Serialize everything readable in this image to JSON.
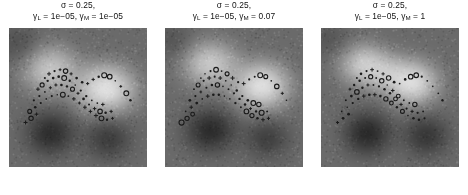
{
  "figure": {
    "background_color": "#ffffff",
    "panel_count": 3,
    "colormap": "gray"
  },
  "panels": [
    {
      "id": "panel-1",
      "title_line1": "σ = 0.25,",
      "title_line2_a": "γ",
      "title_line2_a_sub": "L",
      "title_line2_b": " = 1e−05,  ",
      "title_line2_c": "γ",
      "title_line2_c_sub": "M",
      "title_line2_d": " = 1e−05",
      "sigma": "0.25",
      "gamma_L": "1e-05",
      "gamma_M": "1e-05"
    },
    {
      "id": "panel-2",
      "title_line1": "σ = 0.25,",
      "title_line2_a": "γ",
      "title_line2_a_sub": "L",
      "title_line2_b": " = 1e−05, ",
      "title_line2_c": "γ",
      "title_line2_c_sub": "M",
      "title_line2_d": " = 0.07",
      "sigma": "0.25",
      "gamma_L": "1e-05",
      "gamma_M": "0.07"
    },
    {
      "id": "panel-3",
      "title_line1": "σ = 0.25,",
      "title_line2_a": "γ",
      "title_line2_a_sub": "L",
      "title_line2_b": " = 1e−05, ",
      "title_line2_c": "γ",
      "title_line2_c_sub": "M",
      "title_line2_d": " = 1",
      "sigma": "0.25",
      "gamma_L": "1e-05",
      "gamma_M": "1"
    }
  ],
  "chart_data": {
    "type": "heatmap",
    "title": "",
    "xlabel": "",
    "ylabel": "",
    "grid": false,
    "legend": "none",
    "colormap": "gray",
    "axis_ticks": [],
    "panels": [
      {
        "name": "σ = 0.25, γ_L = 1e-05, γ_M = 1e-05",
        "field_lobes": [
          {
            "kind": "bright",
            "cx": 0.3,
            "cy": 0.3,
            "rx": 0.3,
            "ry": 0.24,
            "intensity": 0.78
          },
          {
            "kind": "bright",
            "cx": 0.7,
            "cy": 0.44,
            "rx": 0.33,
            "ry": 0.26,
            "intensity": 1.0
          },
          {
            "kind": "dark",
            "cx": 0.3,
            "cy": 0.76,
            "rx": 0.26,
            "ry": 0.22,
            "intensity": 0.8
          },
          {
            "kind": "dark",
            "cx": 0.72,
            "cy": 0.8,
            "rx": 0.24,
            "ry": 0.2,
            "intensity": 0.62
          },
          {
            "kind": "dark",
            "cx": 0.06,
            "cy": 0.12,
            "rx": 0.22,
            "ry": 0.2,
            "intensity": 0.35
          }
        ],
        "scatter": {
          "marker_shapes": [
            "dot",
            "circle",
            "cross"
          ],
          "marker_color": "#1a1a1a",
          "n_points": 64,
          "x": [
            0.26,
            0.29,
            0.33,
            0.37,
            0.41,
            0.45,
            0.49,
            0.53,
            0.21,
            0.24,
            0.28,
            0.32,
            0.36,
            0.4,
            0.44,
            0.48,
            0.52,
            0.56,
            0.6,
            0.64,
            0.68,
            0.18,
            0.22,
            0.26,
            0.3,
            0.34,
            0.38,
            0.42,
            0.46,
            0.5,
            0.54,
            0.58,
            0.62,
            0.66,
            0.7,
            0.74,
            0.15,
            0.19,
            0.23,
            0.27,
            0.31,
            0.35,
            0.39,
            0.43,
            0.47,
            0.51,
            0.55,
            0.59,
            0.63,
            0.67,
            0.71,
            0.75,
            0.12,
            0.16,
            0.2,
            0.57,
            0.61,
            0.65,
            0.69,
            0.73,
            0.77,
            0.81,
            0.85,
            0.88
          ],
          "y": [
            0.36,
            0.33,
            0.31,
            0.3,
            0.31,
            0.33,
            0.36,
            0.39,
            0.44,
            0.41,
            0.38,
            0.36,
            0.35,
            0.36,
            0.38,
            0.41,
            0.45,
            0.49,
            0.52,
            0.54,
            0.55,
            0.52,
            0.49,
            0.46,
            0.43,
            0.41,
            0.41,
            0.42,
            0.44,
            0.47,
            0.51,
            0.55,
            0.58,
            0.6,
            0.61,
            0.6,
            0.6,
            0.57,
            0.54,
            0.51,
            0.49,
            0.48,
            0.48,
            0.49,
            0.51,
            0.54,
            0.57,
            0.6,
            0.63,
            0.65,
            0.66,
            0.65,
            0.68,
            0.65,
            0.62,
            0.4,
            0.37,
            0.35,
            0.34,
            0.35,
            0.38,
            0.42,
            0.47,
            0.52
          ]
        }
      },
      {
        "name": "σ = 0.25, γ_L = 1e-05, γ_M = 0.07",
        "field_lobes": [
          {
            "kind": "bright",
            "cx": 0.33,
            "cy": 0.26,
            "rx": 0.3,
            "ry": 0.23,
            "intensity": 0.82
          },
          {
            "kind": "bright",
            "cx": 0.7,
            "cy": 0.42,
            "rx": 0.31,
            "ry": 0.25,
            "intensity": 1.0
          },
          {
            "kind": "dark",
            "cx": 0.33,
            "cy": 0.74,
            "rx": 0.27,
            "ry": 0.22,
            "intensity": 0.82
          },
          {
            "kind": "dark",
            "cx": 0.74,
            "cy": 0.8,
            "rx": 0.23,
            "ry": 0.19,
            "intensity": 0.6
          },
          {
            "kind": "dark",
            "cx": 0.05,
            "cy": 0.1,
            "rx": 0.2,
            "ry": 0.18,
            "intensity": 0.32
          }
        ],
        "scatter": {
          "marker_shapes": [
            "dot",
            "circle",
            "cross"
          ],
          "marker_color": "#1a1a1a",
          "n_points": 64,
          "x": [
            0.26,
            0.29,
            0.33,
            0.37,
            0.41,
            0.45,
            0.49,
            0.53,
            0.21,
            0.24,
            0.28,
            0.32,
            0.36,
            0.4,
            0.44,
            0.48,
            0.52,
            0.56,
            0.6,
            0.64,
            0.68,
            0.18,
            0.22,
            0.26,
            0.3,
            0.34,
            0.38,
            0.42,
            0.46,
            0.5,
            0.54,
            0.58,
            0.62,
            0.66,
            0.7,
            0.74,
            0.15,
            0.19,
            0.23,
            0.27,
            0.31,
            0.35,
            0.39,
            0.43,
            0.47,
            0.51,
            0.55,
            0.59,
            0.63,
            0.67,
            0.71,
            0.75,
            0.12,
            0.16,
            0.2,
            0.57,
            0.61,
            0.65,
            0.69,
            0.73,
            0.77,
            0.81,
            0.85,
            0.88
          ],
          "y": [
            0.36,
            0.33,
            0.31,
            0.3,
            0.31,
            0.33,
            0.36,
            0.39,
            0.44,
            0.41,
            0.38,
            0.36,
            0.35,
            0.36,
            0.38,
            0.41,
            0.45,
            0.49,
            0.52,
            0.54,
            0.55,
            0.52,
            0.49,
            0.46,
            0.43,
            0.41,
            0.41,
            0.42,
            0.44,
            0.47,
            0.51,
            0.55,
            0.58,
            0.6,
            0.61,
            0.6,
            0.6,
            0.57,
            0.54,
            0.51,
            0.49,
            0.48,
            0.48,
            0.49,
            0.51,
            0.54,
            0.57,
            0.6,
            0.63,
            0.65,
            0.66,
            0.65,
            0.68,
            0.65,
            0.62,
            0.4,
            0.37,
            0.35,
            0.34,
            0.35,
            0.38,
            0.42,
            0.47,
            0.52
          ]
        }
      },
      {
        "name": "σ = 0.25, γ_L = 1e-05, γ_M = 1",
        "field_lobes": [
          {
            "kind": "bright",
            "cx": 0.32,
            "cy": 0.27,
            "rx": 0.27,
            "ry": 0.21,
            "intensity": 0.88
          },
          {
            "kind": "bright",
            "cx": 0.66,
            "cy": 0.4,
            "rx": 0.28,
            "ry": 0.23,
            "intensity": 1.0
          },
          {
            "kind": "bright",
            "cx": 0.49,
            "cy": 0.33,
            "rx": 0.22,
            "ry": 0.15,
            "intensity": 0.7
          },
          {
            "kind": "dark",
            "cx": 0.34,
            "cy": 0.76,
            "rx": 0.25,
            "ry": 0.22,
            "intensity": 0.86
          },
          {
            "kind": "dark",
            "cx": 0.76,
            "cy": 0.78,
            "rx": 0.24,
            "ry": 0.2,
            "intensity": 0.7
          },
          {
            "kind": "dark",
            "cx": 0.05,
            "cy": 0.08,
            "rx": 0.2,
            "ry": 0.18,
            "intensity": 0.3
          }
        ],
        "scatter": {
          "marker_shapes": [
            "dot",
            "circle",
            "cross"
          ],
          "marker_color": "#1a1a1a",
          "n_points": 64,
          "x": [
            0.26,
            0.29,
            0.33,
            0.37,
            0.41,
            0.45,
            0.49,
            0.53,
            0.21,
            0.24,
            0.28,
            0.32,
            0.36,
            0.4,
            0.44,
            0.48,
            0.52,
            0.56,
            0.6,
            0.64,
            0.68,
            0.18,
            0.22,
            0.26,
            0.3,
            0.34,
            0.38,
            0.42,
            0.46,
            0.5,
            0.54,
            0.58,
            0.62,
            0.66,
            0.7,
            0.74,
            0.15,
            0.19,
            0.23,
            0.27,
            0.31,
            0.35,
            0.39,
            0.43,
            0.47,
            0.51,
            0.55,
            0.59,
            0.63,
            0.67,
            0.71,
            0.75,
            0.12,
            0.16,
            0.2,
            0.57,
            0.61,
            0.65,
            0.69,
            0.73,
            0.77,
            0.81,
            0.85,
            0.88
          ],
          "y": [
            0.36,
            0.33,
            0.31,
            0.3,
            0.31,
            0.33,
            0.36,
            0.39,
            0.44,
            0.41,
            0.38,
            0.36,
            0.35,
            0.36,
            0.38,
            0.41,
            0.45,
            0.49,
            0.52,
            0.54,
            0.55,
            0.52,
            0.49,
            0.46,
            0.43,
            0.41,
            0.41,
            0.42,
            0.44,
            0.47,
            0.51,
            0.55,
            0.58,
            0.6,
            0.61,
            0.6,
            0.6,
            0.57,
            0.54,
            0.51,
            0.49,
            0.48,
            0.48,
            0.49,
            0.51,
            0.54,
            0.57,
            0.6,
            0.63,
            0.65,
            0.66,
            0.65,
            0.68,
            0.65,
            0.62,
            0.4,
            0.37,
            0.35,
            0.34,
            0.35,
            0.38,
            0.42,
            0.47,
            0.52
          ]
        }
      }
    ]
  }
}
